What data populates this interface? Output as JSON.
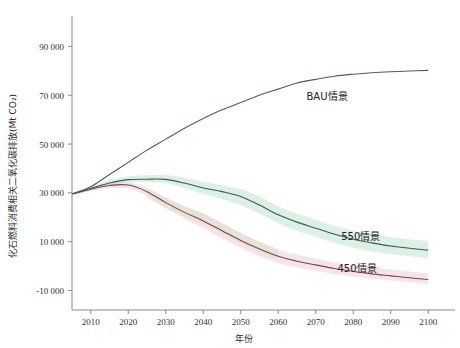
{
  "chart_data": {
    "type": "line",
    "title": "",
    "xlabel": "年份",
    "ylabel": "化石燃料消费相关二氧化碳排放(Mt CO₂)",
    "xlim": [
      2005,
      2105
    ],
    "ylim": [
      -18000,
      100000
    ],
    "xticks": [
      2010,
      2020,
      2030,
      2040,
      2050,
      2060,
      2070,
      2080,
      2090,
      2100
    ],
    "xtick_labels": [
      "2010",
      "2020",
      "2030",
      "2040",
      "2050",
      "2060",
      "2070",
      "2080",
      "2090",
      "2100"
    ],
    "yticks": [
      -10000,
      10000,
      30000,
      50000,
      70000,
      90000
    ],
    "ytick_labels": [
      "-10 000",
      "10 000",
      "30 000",
      "50 000",
      "70 000",
      "90 000"
    ],
    "grid": false,
    "legend_position": "inline-annotations",
    "x": [
      2005,
      2010,
      2015,
      2020,
      2025,
      2030,
      2035,
      2040,
      2045,
      2050,
      2055,
      2060,
      2065,
      2070,
      2075,
      2080,
      2085,
      2090,
      2095,
      2100
    ],
    "series": [
      {
        "name": "BAU情景",
        "color": "#4a5a7a",
        "values": [
          29500,
          32500,
          37500,
          42500,
          47500,
          52000,
          56500,
          60500,
          64000,
          67000,
          70000,
          72500,
          75000,
          76500,
          77800,
          78600,
          79200,
          79600,
          79900,
          80200
        ]
      },
      {
        "name": "550情景",
        "color": "#3c5c4c",
        "values": [
          29500,
          31800,
          34000,
          35400,
          35600,
          35500,
          34000,
          32000,
          30500,
          28500,
          25000,
          21000,
          18000,
          15500,
          13000,
          11000,
          9500,
          8200,
          7300,
          6500
        ],
        "band_low": [
          29000,
          31000,
          33000,
          34300,
          34400,
          34000,
          32000,
          29500,
          27500,
          25000,
          21500,
          17500,
          14500,
          12000,
          9500,
          7500,
          6000,
          4800,
          4000,
          3200
        ],
        "band_high": [
          30000,
          32600,
          35200,
          36800,
          37200,
          37300,
          36200,
          34500,
          33000,
          31500,
          28500,
          24500,
          21500,
          19000,
          16500,
          14500,
          13000,
          11800,
          11000,
          10200
        ]
      },
      {
        "name": "450情景",
        "color": "#6d4a58",
        "values": [
          29500,
          31500,
          33000,
          33200,
          30500,
          26000,
          22000,
          18500,
          14500,
          10500,
          7000,
          4000,
          2000,
          500,
          -1000,
          -2200,
          -3200,
          -4000,
          -4800,
          -5500
        ],
        "band_low": [
          29000,
          30800,
          32000,
          32000,
          29000,
          24000,
          19500,
          15500,
          11500,
          7500,
          4000,
          1200,
          -600,
          -2000,
          -3300,
          -4300,
          -5200,
          -5900,
          -6600,
          -7200
        ],
        "band_high": [
          30000,
          32200,
          34000,
          34400,
          32000,
          28000,
          24500,
          21500,
          17500,
          13500,
          10000,
          6800,
          4600,
          3000,
          1500,
          400,
          -600,
          -1400,
          -2200,
          -3000
        ]
      }
    ],
    "annotations": [
      {
        "text": "BAU情景",
        "x": 2073,
        "y": 68000
      },
      {
        "text": "550情景",
        "x": 2082,
        "y": 10500
      },
      {
        "text": "450情景",
        "x": 2081,
        "y": -2500
      }
    ]
  }
}
